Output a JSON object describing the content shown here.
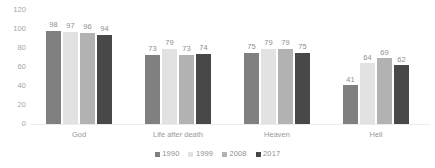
{
  "chart_data": {
    "type": "bar",
    "title": "",
    "subtitle": "",
    "xlabel": "",
    "ylabel": "",
    "ylim": [
      0,
      120
    ],
    "yticks": [
      0,
      20,
      40,
      60,
      80,
      100,
      120
    ],
    "grid": false,
    "legend_position": "bottom",
    "categories": [
      "God",
      "Life after death",
      "Heaven",
      "Hell"
    ],
    "series": [
      {
        "name": "1990",
        "color": "#808080",
        "values": [
          98,
          73,
          75,
          41
        ]
      },
      {
        "name": "1999",
        "color": "#e2e2e2",
        "values": [
          97,
          79,
          79,
          64
        ]
      },
      {
        "name": "2008",
        "color": "#b2b2b2",
        "values": [
          96,
          73,
          79,
          69
        ]
      },
      {
        "name": "2017",
        "color": "#484848",
        "values": [
          94,
          74,
          75,
          62
        ]
      }
    ]
  },
  "axis": {
    "y_ticks": [
      "120",
      "100",
      "80",
      "60",
      "40",
      "20",
      "0"
    ]
  },
  "groups": [
    {
      "label": "God",
      "bars": [
        {
          "series": "1990",
          "value": "98"
        },
        {
          "series": "1999",
          "value": "97"
        },
        {
          "series": "2008",
          "value": "96"
        },
        {
          "series": "2017",
          "value": "94"
        }
      ]
    },
    {
      "label": "Life after death",
      "bars": [
        {
          "series": "1990",
          "value": "73"
        },
        {
          "series": "1999",
          "value": "79"
        },
        {
          "series": "2008",
          "value": "73"
        },
        {
          "series": "2017",
          "value": "74"
        }
      ]
    },
    {
      "label": "Heaven",
      "bars": [
        {
          "series": "1990",
          "value": "75"
        },
        {
          "series": "1999",
          "value": "79"
        },
        {
          "series": "2008",
          "value": "79"
        },
        {
          "series": "2017",
          "value": "75"
        }
      ]
    },
    {
      "label": "Hell",
      "bars": [
        {
          "series": "1990",
          "value": "41"
        },
        {
          "series": "1999",
          "value": "64"
        },
        {
          "series": "2008",
          "value": "69"
        },
        {
          "series": "2017",
          "value": "62"
        }
      ]
    }
  ],
  "legend": {
    "items": [
      {
        "label": "1990",
        "color": "#808080"
      },
      {
        "label": "1999",
        "color": "#e2e2e2"
      },
      {
        "label": "2008",
        "color": "#b2b2b2"
      },
      {
        "label": "2017",
        "color": "#484848"
      }
    ]
  }
}
